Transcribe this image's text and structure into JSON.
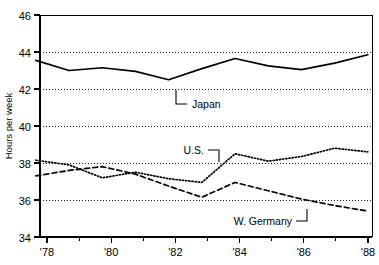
{
  "chart_data": {
    "type": "line",
    "title": "",
    "subtitle": "",
    "xlabel": "",
    "ylabel": "Hours per week",
    "xlim": [
      1978,
      1988
    ],
    "ylim": [
      34,
      46
    ],
    "yticks": [
      34,
      36,
      38,
      40,
      42,
      44,
      46
    ],
    "ytick_labels": [
      "34",
      "36",
      "38",
      "40",
      "42",
      "44",
      "46"
    ],
    "xticks": [
      1978,
      1980,
      1982,
      1984,
      1986,
      1988
    ],
    "xtick_labels": [
      "'78",
      "'80",
      "'82",
      "'84",
      "'86",
      "'88"
    ],
    "x_minor_ticks": [
      1979,
      1981,
      1983,
      1985,
      1987
    ],
    "grid": "horizontal-dotted",
    "legend_position": "inline-annotations",
    "x": [
      1978,
      1979,
      1980,
      1981,
      1982,
      1983,
      1984,
      1985,
      1986,
      1987,
      1988
    ],
    "series": [
      {
        "name": "Japan",
        "style": "solid",
        "color": "#000000",
        "values": [
          43.55,
          43.0,
          43.15,
          42.95,
          42.5,
          43.1,
          43.65,
          43.25,
          43.05,
          43.4,
          43.85
        ]
      },
      {
        "name": "U.S.",
        "style": "dotted",
        "color": "#000000",
        "values": [
          38.15,
          37.9,
          37.2,
          37.5,
          37.15,
          36.95,
          38.5,
          38.1,
          38.35,
          38.8,
          38.6
        ]
      },
      {
        "name": "W. Germany",
        "style": "dashed",
        "color": "#000000",
        "values": [
          37.3,
          37.6,
          37.8,
          37.4,
          36.75,
          36.15,
          36.95,
          36.5,
          36.05,
          35.7,
          35.4
        ]
      }
    ],
    "annotations": [
      {
        "text": "Japan",
        "series": "Japan",
        "leader": "elbow-up-left"
      },
      {
        "text": "U.S.",
        "series": "U.S.",
        "leader": "elbow-right-down"
      },
      {
        "text": "W. Germany",
        "series": "W. Germany",
        "leader": "elbow-up-right"
      }
    ]
  },
  "axis": {
    "y_title": "Hours per week",
    "y_labels": [
      "46",
      "44",
      "42",
      "40",
      "38",
      "36",
      "34"
    ],
    "x_labels": [
      "'78",
      "'80",
      "'82",
      "'84",
      "'86",
      "'88"
    ]
  },
  "labels": {
    "japan": "Japan",
    "us": "U.S.",
    "w_germany": "W. Germany"
  }
}
